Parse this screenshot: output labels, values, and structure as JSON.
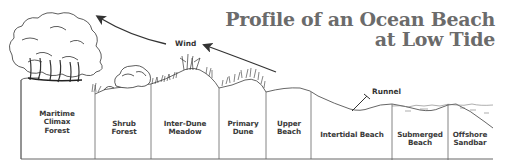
{
  "title": {
    "line1": "Profile of an Ocean Beach",
    "line2": "at Low Tide"
  },
  "annotations": {
    "wind": "Wind",
    "runnel": "Runnel"
  },
  "zones": [
    {
      "label": "Maritime\nClimax\nForest",
      "x_start": 21,
      "x_end": 95
    },
    {
      "label": "Shrub\nForest",
      "x_start": 95,
      "x_end": 151
    },
    {
      "label": "Inter-Dune\nMeadow",
      "x_start": 151,
      "x_end": 219
    },
    {
      "label": "Primary\nDune",
      "x_start": 219,
      "x_end": 266
    },
    {
      "label": "Upper\nBeach",
      "x_start": 266,
      "x_end": 311
    },
    {
      "label": "Intertidal Beach",
      "x_start": 311,
      "x_end": 392
    },
    {
      "label": "Submerged\nBeach",
      "x_start": 392,
      "x_end": 448
    },
    {
      "label": "Offshore\nSandbar",
      "x_start": 448,
      "x_end": 493
    }
  ],
  "colors": {
    "line": "#555555",
    "title": "#6b6b6b",
    "label": "#3a3a3a"
  }
}
